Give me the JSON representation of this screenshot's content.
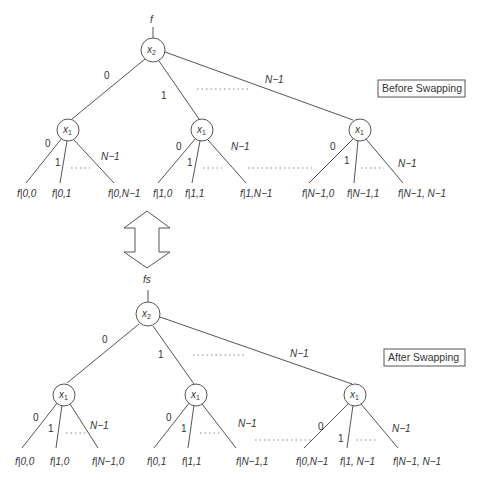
{
  "before": {
    "title": "Before Swapping",
    "input_label": "f",
    "root": {
      "var": "x",
      "sub": "2"
    },
    "root_edges": [
      "0",
      "1",
      "N−1"
    ],
    "children": [
      {
        "var": "x",
        "sub": "1",
        "edges": [
          "0",
          "1",
          "N−1"
        ],
        "leaves": [
          "f|0,0",
          "f|0,1",
          "f|0,N−1"
        ]
      },
      {
        "var": "x",
        "sub": "1",
        "edges": [
          "0",
          "1",
          "N−1"
        ],
        "leaves": [
          "f|1,0",
          "f|1,1",
          "f|1,N−1"
        ]
      },
      {
        "var": "x",
        "sub": "1",
        "edges": [
          "0",
          "1",
          "N−1"
        ],
        "leaves": [
          "f|N−1,0",
          "f|N−1,1",
          "f|N−1, N−1"
        ]
      }
    ]
  },
  "after": {
    "title": "After Swapping",
    "input_label": "fs",
    "root": {
      "var": "x",
      "sub": "2"
    },
    "root_edges": [
      "0",
      "1",
      "N−1"
    ],
    "children": [
      {
        "var": "x",
        "sub": "1",
        "edges": [
          "0",
          "1",
          "N−1"
        ],
        "leaves": [
          "f|0,0",
          "f|1,0",
          "f|N−1,0"
        ]
      },
      {
        "var": "x",
        "sub": "1",
        "edges": [
          "0",
          "1",
          "N−1"
        ],
        "leaves": [
          "f|0,1",
          "f|1,1",
          "f|N−1,1"
        ]
      },
      {
        "var": "x",
        "sub": "1",
        "edges": [
          "0",
          "1",
          "N−1"
        ],
        "leaves": [
          "f|0,N−1",
          "f|1, N−1",
          "f|N−1, N−1"
        ]
      }
    ]
  },
  "swap_arrow": {
    "icon": "double-arrow-vertical-icon"
  }
}
